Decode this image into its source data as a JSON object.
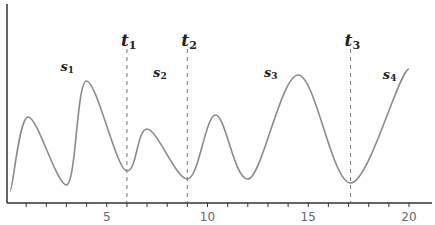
{
  "chart_data": {
    "type": "line",
    "title": "",
    "xlabel": "",
    "ylabel": "",
    "xlim": [
      0,
      21.2
    ],
    "ylim": [
      0,
      1
    ],
    "grid": false,
    "legend": null,
    "x_ticks_major": [
      5,
      10,
      15,
      20
    ],
    "x_tick_labels": [
      "5",
      "10",
      "15",
      "20"
    ],
    "x_ticks_minor": [
      1,
      2,
      3,
      4,
      6,
      7,
      8,
      9,
      11,
      12,
      13,
      14,
      16,
      17,
      18,
      19
    ],
    "series": [
      {
        "name": "signal",
        "color": "#8a8a8a",
        "points": [
          [
            0.2,
            0.06
          ],
          [
            1.1,
            0.43
          ],
          [
            3.0,
            0.09
          ],
          [
            4.0,
            0.61
          ],
          [
            6.0,
            0.16
          ],
          [
            7.0,
            0.37
          ],
          [
            9.0,
            0.12
          ],
          [
            10.4,
            0.44
          ],
          [
            12.0,
            0.12
          ],
          [
            14.5,
            0.64
          ],
          [
            17.1,
            0.1
          ],
          [
            20.0,
            0.67
          ]
        ]
      }
    ],
    "vertical_markers": [
      {
        "x": 6.0,
        "label": "t",
        "sub": "1"
      },
      {
        "x": 9.0,
        "label": "t",
        "sub": "2"
      },
      {
        "x": 17.1,
        "label": "t",
        "sub": "3"
      }
    ],
    "segment_labels": [
      {
        "x": 2.7,
        "y": 0.66,
        "label": "s",
        "sub": "1"
      },
      {
        "x": 7.3,
        "y": 0.63,
        "label": "s",
        "sub": "2"
      },
      {
        "x": 12.8,
        "y": 0.63,
        "label": "s",
        "sub": "3"
      },
      {
        "x": 18.7,
        "y": 0.62,
        "label": "s",
        "sub": "4"
      }
    ]
  }
}
